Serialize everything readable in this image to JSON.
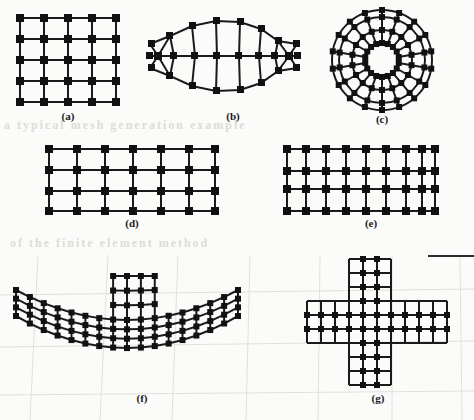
{
  "page": {
    "width": 474,
    "height": 420,
    "background_color": "#fbfbfa",
    "ink_color": "#1a1a1a",
    "node_color": "#111111",
    "ghost_color": "#d9d7d2"
  },
  "figures": [
    {
      "id": "a",
      "caption": "(a)",
      "kind": "rectangular-grid",
      "cols": 5,
      "rows": 5,
      "node_count": 25,
      "note": "regular square grid, 4 x 4 cells"
    },
    {
      "id": "b",
      "caption": "(b)",
      "kind": "lens-mesh",
      "radial_bands": 2,
      "angular_divisions": 12,
      "node_count": 34,
      "note": "eye / lens shaped curved mesh with central horizontal spine"
    },
    {
      "id": "c",
      "caption": "(c)",
      "kind": "annulus-mesh",
      "rings": 4,
      "sectors": 18,
      "node_count": 72,
      "note": "circular annular mesh, three concentric bands of quadrilaterals"
    },
    {
      "id": "d",
      "caption": "(d)",
      "kind": "rectangular-grid",
      "cols": 7,
      "rows": 4,
      "node_count": 28,
      "note": "wide rectangular grid, 6 x 3 cells"
    },
    {
      "id": "e",
      "caption": "(e)",
      "kind": "rectangular-grid",
      "cols": 9,
      "rows": 4,
      "node_count": 36,
      "note": "wide rectangular grid, 8 x 3 cells"
    },
    {
      "id": "f",
      "caption": "(f)",
      "kind": "curved-tee-mesh",
      "arm_cols": 17,
      "arm_rows": 4,
      "stem_cols": 3,
      "stem_rows": 3,
      "note": "shallow downward-curving arched band with a rectangular stem rising from its centre"
    },
    {
      "id": "g",
      "caption": "(g)",
      "kind": "cross-mesh",
      "arm_cells_long": 9,
      "arm_cells_short": 3,
      "note": "plus / cruciform shaped mesh, horizontal and vertical arms of equal width"
    }
  ],
  "captions": {
    "a": "(a)",
    "b": "(b)",
    "c": "(c)",
    "d": "(d)",
    "e": "(e)",
    "f": "(f)",
    "g": "(g)"
  },
  "ghost_text": {
    "line1": "a typical mesh generation example",
    "line2": "of the finite element method"
  }
}
